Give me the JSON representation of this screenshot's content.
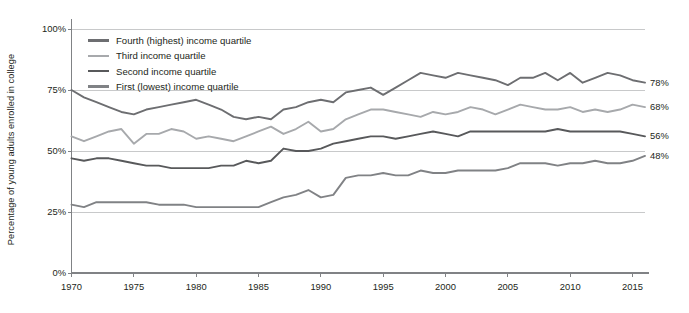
{
  "chart_data": {
    "type": "line",
    "title": "",
    "subtitle": "",
    "xlabel": "",
    "ylabel": "Percentage of young adults enrolled in college",
    "xlim": [
      1970,
      2016
    ],
    "ylim": [
      0,
      100
    ],
    "y_ticks": [
      "0%",
      "25%",
      "50%",
      "75%",
      "100%"
    ],
    "y_tick_values": [
      0,
      25,
      50,
      75,
      100
    ],
    "x_ticks": [
      "1970",
      "1975",
      "1980",
      "1985",
      "1990",
      "1995",
      "2000",
      "2005",
      "2010",
      "2015"
    ],
    "x_tick_values": [
      1970,
      1975,
      1980,
      1985,
      1990,
      1995,
      2000,
      2005,
      2010,
      2015
    ],
    "grid": "horizontal",
    "legend_position": "top-left",
    "x": [
      1970,
      1971,
      1972,
      1973,
      1974,
      1975,
      1976,
      1977,
      1978,
      1979,
      1980,
      1981,
      1982,
      1983,
      1984,
      1985,
      1986,
      1987,
      1988,
      1989,
      1990,
      1991,
      1992,
      1993,
      1994,
      1995,
      1996,
      1997,
      1998,
      1999,
      2000,
      2001,
      2002,
      2003,
      2004,
      2005,
      2006,
      2007,
      2008,
      2009,
      2010,
      2011,
      2012,
      2013,
      2014,
      2015,
      2016
    ],
    "series": [
      {
        "name": "Fourth (highest) income quartile",
        "color": "#6d6e71",
        "end_label": "78%",
        "values": [
          75,
          72,
          70,
          68,
          66,
          65,
          67,
          68,
          69,
          70,
          71,
          69,
          67,
          64,
          63,
          64,
          63,
          67,
          68,
          70,
          71,
          70,
          74,
          75,
          76,
          73,
          76,
          79,
          82,
          81,
          80,
          82,
          81,
          80,
          79,
          77,
          80,
          80,
          82,
          79,
          82,
          78,
          80,
          82,
          81,
          79,
          78
        ]
      },
      {
        "name": "Third income quartile",
        "color": "#a7a9ac",
        "end_label": "68%",
        "values": [
          56,
          54,
          56,
          58,
          59,
          53,
          57,
          57,
          59,
          58,
          55,
          56,
          55,
          54,
          56,
          58,
          60,
          57,
          59,
          62,
          58,
          59,
          63,
          65,
          67,
          67,
          66,
          65,
          64,
          66,
          65,
          66,
          68,
          67,
          65,
          67,
          69,
          68,
          67,
          67,
          68,
          66,
          67,
          66,
          67,
          69,
          68
        ]
      },
      {
        "name": "Second income quartile",
        "color": "#58595b",
        "end_label": "56%",
        "values": [
          47,
          46,
          47,
          47,
          46,
          45,
          44,
          44,
          43,
          43,
          43,
          43,
          44,
          44,
          46,
          45,
          46,
          51,
          50,
          50,
          51,
          53,
          54,
          55,
          56,
          56,
          55,
          56,
          57,
          58,
          57,
          56,
          58,
          58,
          58,
          58,
          58,
          58,
          58,
          59,
          58,
          58,
          58,
          58,
          58,
          57,
          56
        ]
      },
      {
        "name": "First (lowest) income quartile",
        "color": "#808285",
        "end_label": "48%",
        "values": [
          28,
          27,
          29,
          29,
          29,
          29,
          29,
          28,
          28,
          28,
          27,
          27,
          27,
          27,
          27,
          27,
          29,
          31,
          32,
          34,
          31,
          32,
          39,
          40,
          40,
          41,
          40,
          40,
          42,
          41,
          41,
          42,
          42,
          42,
          42,
          43,
          45,
          45,
          45,
          44,
          45,
          45,
          46,
          45,
          45,
          46,
          48
        ]
      }
    ]
  },
  "axis": {
    "y_title": "Percentage of young adults enrolled in college"
  },
  "colors": {
    "grid": "#c8c9ca",
    "axis": "#808285",
    "text": "#231f20"
  }
}
